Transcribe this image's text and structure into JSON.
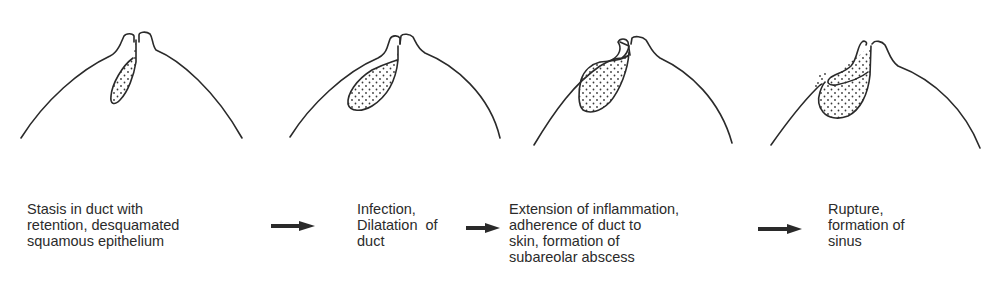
{
  "diagram": {
    "type": "process-sequence",
    "stages": [
      {
        "id": 1,
        "lines": [
          "Stasis in duct with",
          "retention, desquamated",
          "squamous epithelium"
        ],
        "pos": {
          "left": 27,
          "top": 201
        }
      },
      {
        "id": 2,
        "lines": [
          "Infection,",
          "Dilatation  of",
          "duct"
        ],
        "pos": {
          "left": 357,
          "top": 201
        }
      },
      {
        "id": 3,
        "lines": [
          "Extension of inflammation,",
          "adherence of duct to",
          "skin, formation of",
          "subareolar abscess"
        ],
        "pos": {
          "left": 509,
          "top": 201
        }
      },
      {
        "id": 4,
        "lines": [
          "Rupture,",
          "formation of",
          "sinus"
        ],
        "pos": {
          "left": 828,
          "top": 201
        }
      }
    ],
    "arrows": [
      {
        "from": 1,
        "to": 2,
        "x1": 271,
        "x2": 315,
        "y": 226
      },
      {
        "from": 2,
        "to": 3,
        "x1": 466,
        "x2": 500,
        "y": 228
      },
      {
        "from": 3,
        "to": 4,
        "x1": 758,
        "x2": 802,
        "y": 229
      }
    ],
    "colors": {
      "line": "#2a2a2a",
      "stipple": "#3a3a3a",
      "background": "#ffffff"
    }
  }
}
